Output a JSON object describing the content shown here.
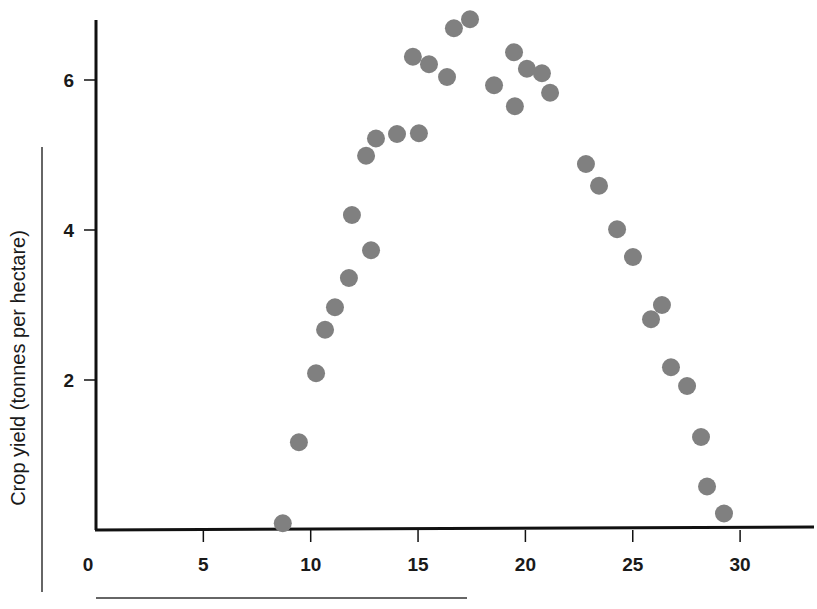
{
  "chart_data": {
    "type": "scatter",
    "title": "",
    "xlabel": "",
    "ylabel": "Crop yield (tonnes per hectare)",
    "xlim": [
      0,
      33.5
    ],
    "ylim": [
      0,
      6.8
    ],
    "x_ticks": [
      0,
      5,
      10,
      15,
      20,
      25,
      30
    ],
    "y_ticks": [
      2,
      4,
      6
    ],
    "grid": false,
    "legend": null,
    "marker_color": "#808080",
    "series": [
      {
        "name": "observations",
        "points": [
          {
            "x": 8.7,
            "y": 0.09
          },
          {
            "x": 9.45,
            "y": 1.17
          },
          {
            "x": 10.25,
            "y": 2.09
          },
          {
            "x": 10.67,
            "y": 2.67
          },
          {
            "x": 11.13,
            "y": 2.97
          },
          {
            "x": 11.78,
            "y": 3.36
          },
          {
            "x": 11.92,
            "y": 4.2
          },
          {
            "x": 12.58,
            "y": 4.99
          },
          {
            "x": 12.81,
            "y": 3.73
          },
          {
            "x": 13.04,
            "y": 5.22
          },
          {
            "x": 14.02,
            "y": 5.28
          },
          {
            "x": 15.04,
            "y": 5.29
          },
          {
            "x": 14.76,
            "y": 6.31
          },
          {
            "x": 15.51,
            "y": 6.21
          },
          {
            "x": 16.35,
            "y": 6.04
          },
          {
            "x": 16.67,
            "y": 6.69
          },
          {
            "x": 17.42,
            "y": 6.81
          },
          {
            "x": 18.54,
            "y": 5.93
          },
          {
            "x": 19.47,
            "y": 6.37
          },
          {
            "x": 19.51,
            "y": 5.65
          },
          {
            "x": 20.07,
            "y": 6.15
          },
          {
            "x": 20.77,
            "y": 6.09
          },
          {
            "x": 21.15,
            "y": 5.83
          },
          {
            "x": 22.82,
            "y": 4.88
          },
          {
            "x": 23.43,
            "y": 4.59
          },
          {
            "x": 24.27,
            "y": 4.01
          },
          {
            "x": 25.01,
            "y": 3.64
          },
          {
            "x": 25.85,
            "y": 2.81
          },
          {
            "x": 26.36,
            "y": 3.0
          },
          {
            "x": 26.78,
            "y": 2.17
          },
          {
            "x": 27.53,
            "y": 1.92
          },
          {
            "x": 28.18,
            "y": 1.24
          },
          {
            "x": 28.46,
            "y": 0.58
          },
          {
            "x": 29.25,
            "y": 0.22
          }
        ]
      }
    ]
  }
}
